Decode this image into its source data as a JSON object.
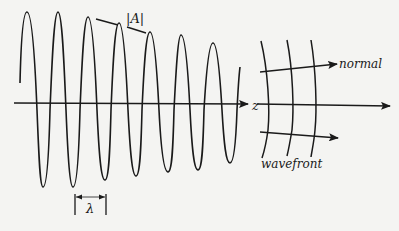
{
  "diagram": {
    "labels": {
      "amplitude": "|A|",
      "wavelength": "λ",
      "axis": "z",
      "normal": "normal",
      "wavefront": "wavefront"
    },
    "colors": {
      "background": "#f4f4f2",
      "ink": "#1a1a1a"
    },
    "wave": {
      "peaks": [
        [
          27,
          12
        ],
        [
          58,
          12
        ],
        [
          88,
          17
        ],
        [
          119,
          23
        ],
        [
          150,
          32
        ],
        [
          181,
          35
        ],
        [
          213,
          43
        ]
      ],
      "troughs": [
        [
          43,
          187
        ],
        [
          73,
          187
        ],
        [
          105,
          180
        ],
        [
          136,
          176
        ],
        [
          168,
          172
        ],
        [
          198,
          170
        ],
        [
          230,
          163
        ]
      ],
      "start": [
        20,
        83
      ],
      "end": [
        240,
        67
      ]
    }
  }
}
